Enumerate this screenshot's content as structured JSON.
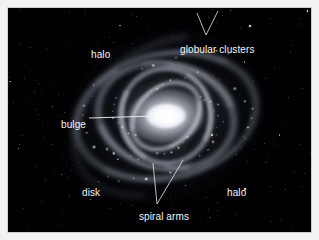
{
  "figure": {
    "type": "astronomy-diagram",
    "background_color": "#010103",
    "label_color": "#f4f4f4",
    "frame_color": "#cfcfcb"
  },
  "labels": [
    {
      "id": "halo-top",
      "text": "halo",
      "has_leader": false
    },
    {
      "id": "globular",
      "text": "globular clusters",
      "has_leader": true
    },
    {
      "id": "bulge",
      "text": "bulge",
      "has_leader": true
    },
    {
      "id": "disk",
      "text": "disk",
      "has_leader": false
    },
    {
      "id": "spiral",
      "text": "spiral arms",
      "has_leader": true
    },
    {
      "id": "halo-bot",
      "text": "halo",
      "has_leader": false
    }
  ],
  "chart_data": {
    "type": "diagram",
    "title": "",
    "annotations": [
      "halo",
      "globular clusters",
      "bulge",
      "disk",
      "spiral arms",
      "halo"
    ]
  }
}
